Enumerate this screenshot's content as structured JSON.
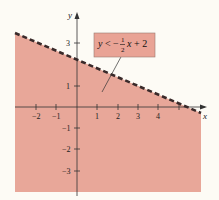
{
  "graph": {
    "x_axis_label": "x",
    "y_axis_label": "y",
    "x_ticks": [
      {
        "value": -2,
        "label": "−2"
      },
      {
        "value": -1,
        "label": "−1"
      },
      {
        "value": 1,
        "label": "1"
      },
      {
        "value": 2,
        "label": "2"
      },
      {
        "value": 3,
        "label": "3"
      },
      {
        "value": 4,
        "label": "4"
      },
      {
        "value": 5,
        "label": ""
      }
    ],
    "y_ticks": [
      {
        "value": 3,
        "label": "3"
      },
      {
        "value": 1,
        "label": "1"
      },
      {
        "value": -1,
        "label": "−1"
      },
      {
        "value": -2,
        "label": "−2"
      },
      {
        "value": -3,
        "label": "−3"
      }
    ],
    "boundary_line": {
      "slope": -0.5,
      "intercept": 2,
      "style": "dashed"
    },
    "shaded_region": "below",
    "colors": {
      "shade": "#e8a799",
      "line": "#3a2a2a",
      "callout_fill": "#e9a395",
      "background": "#fdfbf5"
    },
    "callout": {
      "y_var": "y",
      "lt": "<",
      "minus": "−",
      "frac_num": "1",
      "frac_den": "2",
      "x_var": "x",
      "rest": "+ 2"
    }
  }
}
